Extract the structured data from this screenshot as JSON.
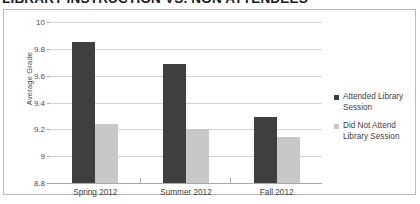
{
  "chart_data": {
    "type": "bar",
    "title": "LIBRARY INSTRUCTION VS. NON ATTENDEES",
    "xlabel": "",
    "ylabel": "Average Grade",
    "categories": [
      "Spring 2012",
      "Summer 2012",
      "Fall 2012"
    ],
    "series": [
      {
        "name": "Attended Library Session",
        "color": "#3f3f3f",
        "values": [
          9.85,
          9.69,
          9.29
        ]
      },
      {
        "name": "Did Not Attend Library Session",
        "color": "#c8c8c8",
        "values": [
          9.24,
          9.2,
          9.14
        ]
      }
    ],
    "ylim": [
      8.8,
      10
    ],
    "ytick_labels": [
      "10",
      "9.8",
      "9.6",
      "9.4",
      "9.2",
      "9",
      "8.8"
    ],
    "ytick_values": [
      10,
      9.8,
      9.6,
      9.4,
      9.2,
      9,
      8.8
    ],
    "grid": true,
    "legend_position": "right"
  },
  "legend": {
    "items": [
      {
        "label": "Attended Library Session"
      },
      {
        "label": "Did Not Attend Library Session"
      }
    ]
  }
}
